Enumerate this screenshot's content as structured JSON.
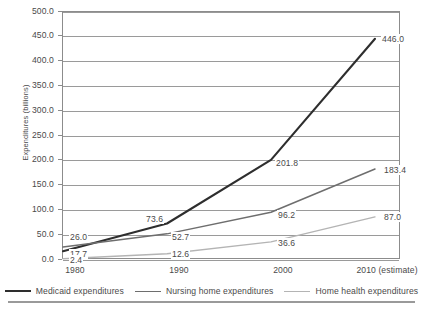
{
  "chart_data": {
    "type": "line",
    "title": "",
    "xlabel": "",
    "ylabel": "Expenditures (billions)",
    "categories": [
      "1980",
      "1990",
      "2000",
      "2010 (estimate)"
    ],
    "x_tick_labels": [
      "1980",
      "1990",
      "2000",
      "2010 (estimate)"
    ],
    "y_tick_labels": [
      "0.0",
      "50.0",
      "100.0",
      "150.0",
      "200.0",
      "250.0",
      "300.0",
      "350.0",
      "400.0",
      "450.0",
      "500.0"
    ],
    "y_tick_values": [
      0,
      50,
      100,
      150,
      200,
      250,
      300,
      350,
      400,
      450,
      500
    ],
    "ylim": [
      0,
      500
    ],
    "grid": "horizontal",
    "legend_position": "bottom",
    "series": [
      {
        "name": "Medicaid expenditures",
        "color": "#2e2e2e",
        "width": 2.1,
        "values": [
          17.7,
          73.6,
          201.8,
          446.0
        ],
        "point_labels": [
          "17.7",
          "73.6",
          "201.8",
          "446.0"
        ]
      },
      {
        "name": "Nursing home expenditures",
        "color": "#6e6e6e",
        "width": 1.5,
        "values": [
          26.0,
          52.7,
          96.2,
          183.4
        ],
        "point_labels": [
          "26.0",
          "52.7",
          "96.2",
          "183.4"
        ]
      },
      {
        "name": "Home health expenditures",
        "color": "#b4b4b4",
        "width": 1.4,
        "values": [
          2.4,
          12.6,
          36.6,
          87.0
        ],
        "point_labels": [
          "2.4",
          "12.6",
          "36.6",
          "87.0"
        ]
      }
    ],
    "annotations": [
      {
        "text": "17.7",
        "series": "Medicaid expenditures",
        "category": "1980"
      },
      {
        "text": "73.6",
        "series": "Medicaid expenditures",
        "category": "1990"
      },
      {
        "text": "201.8",
        "series": "Medicaid expenditures",
        "category": "2000"
      },
      {
        "text": "446.0",
        "series": "Medicaid expenditures",
        "category": "2010 (estimate)"
      },
      {
        "text": "26.0",
        "series": "Nursing home expenditures",
        "category": "1980"
      },
      {
        "text": "52.7",
        "series": "Nursing home expenditures",
        "category": "1990"
      },
      {
        "text": "96.2",
        "series": "Nursing home expenditures",
        "category": "2000"
      },
      {
        "text": "183.4",
        "series": "Nursing home expenditures",
        "category": "2010 (estimate)"
      },
      {
        "text": "2.4",
        "series": "Home health expenditures",
        "category": "1980"
      },
      {
        "text": "12.6",
        "series": "Home health expenditures",
        "category": "1990"
      },
      {
        "text": "36.6",
        "series": "Home health expenditures",
        "category": "2000"
      },
      {
        "text": "87.0",
        "series": "Home health expenditures",
        "category": "2010 (estimate)"
      }
    ]
  },
  "legend": {
    "items": [
      {
        "label": "Medicaid expenditures"
      },
      {
        "label": "Nursing home expenditures"
      },
      {
        "label": "Home health expenditures"
      }
    ]
  },
  "colors": {
    "medicaid": "#2e2e2e",
    "nursing_home": "#6e6e6e",
    "home_health": "#b4b4b4",
    "grid": "#9a9a9a",
    "frame": "#8c8c8c",
    "text": "#4a4a4a"
  }
}
